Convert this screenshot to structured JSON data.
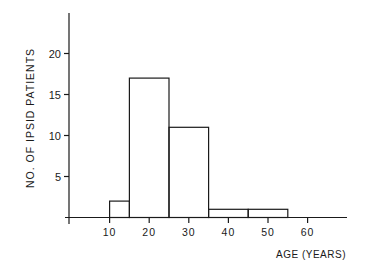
{
  "chart_data": {
    "type": "bar",
    "subtype": "histogram",
    "title": "",
    "xlabel": "AGE (YEARS)",
    "ylabel": "NO. OF IPSID PATIENTS",
    "bins": [
      {
        "start": 10,
        "end": 15,
        "value": 2
      },
      {
        "start": 15,
        "end": 25,
        "value": 17
      },
      {
        "start": 25,
        "end": 35,
        "value": 11
      },
      {
        "start": 35,
        "end": 45,
        "value": 1
      },
      {
        "start": 45,
        "end": 55,
        "value": 1
      }
    ],
    "categories": [
      "10-15",
      "15-25",
      "25-35",
      "35-45",
      "45-55"
    ],
    "values": [
      2,
      17,
      11,
      1,
      1
    ],
    "x_ticks": [
      10,
      20,
      30,
      40,
      50,
      60
    ],
    "y_ticks": [
      5,
      10,
      15,
      20
    ],
    "xlim": [
      0,
      70
    ],
    "ylim": [
      0,
      25
    ],
    "grid": false,
    "legend": null
  },
  "axes": {
    "xlabel": "AGE (YEARS)",
    "ylabel": "NO. OF IPSID PATIENTS",
    "x_tick_labels": [
      "10",
      "20",
      "30",
      "40",
      "50",
      "60"
    ],
    "y_tick_labels": [
      "5",
      "10",
      "15",
      "20"
    ]
  }
}
